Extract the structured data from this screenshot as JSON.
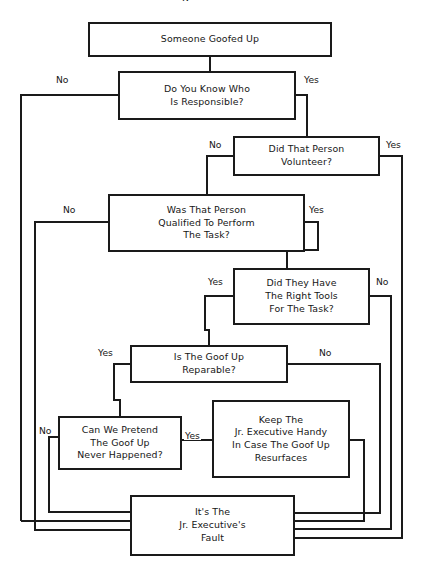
{
  "figure": {
    "type": "flowchart",
    "title_partial": "g",
    "background": "#ffffff",
    "line_color": "#1a1a1a",
    "text_color": "#161616"
  },
  "nodes": [
    {
      "id": "start",
      "text": "Someone Goofed Up"
    },
    {
      "id": "know_who",
      "text": "Do You Know Who\nIs Responsible?"
    },
    {
      "id": "volunteer",
      "text": "Did That Person\nVolunteer?"
    },
    {
      "id": "qualified",
      "text": "Was That Person\nQualified To Perform\nThe Task?"
    },
    {
      "id": "tools",
      "text": "Did They Have\nThe Right Tools\nFor The Task?"
    },
    {
      "id": "reparable",
      "text": "Is The Goof Up\nReparable?"
    },
    {
      "id": "pretend",
      "text": "Can We Pretend\nThe Goof Up\nNever Happened?"
    },
    {
      "id": "keep",
      "text": "Keep The\nJr. Executive Handy\nIn Case The Goof Up\nResurfaces"
    },
    {
      "id": "fault",
      "text": "It's The\nJr. Executive's\nFault"
    }
  ],
  "edge_labels": [
    {
      "id": "know_who_no",
      "text": "No"
    },
    {
      "id": "know_who_yes",
      "text": "Yes"
    },
    {
      "id": "volunteer_no",
      "text": "No"
    },
    {
      "id": "volunteer_yes",
      "text": "Yes"
    },
    {
      "id": "qualified_no",
      "text": "No"
    },
    {
      "id": "qualified_yes",
      "text": "Yes"
    },
    {
      "id": "tools_yes",
      "text": "Yes"
    },
    {
      "id": "tools_no",
      "text": "No"
    },
    {
      "id": "reparable_yes",
      "text": "Yes"
    },
    {
      "id": "reparable_no",
      "text": "No"
    },
    {
      "id": "pretend_no",
      "text": "No"
    },
    {
      "id": "pretend_yes",
      "text": "Yes"
    }
  ]
}
